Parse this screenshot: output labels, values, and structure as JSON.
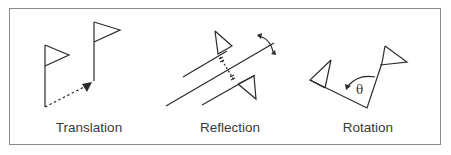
{
  "diagram": {
    "panels": [
      {
        "id": "translation",
        "label": "Translation"
      },
      {
        "id": "reflection",
        "label": "Reflection"
      },
      {
        "id": "rotation",
        "label": "Rotation"
      }
    ],
    "rotation_angle_symbol": "θ",
    "colors": {
      "stroke": "#2a2a2a",
      "border": "#8a8a8a",
      "text": "#3a3a3a"
    }
  }
}
